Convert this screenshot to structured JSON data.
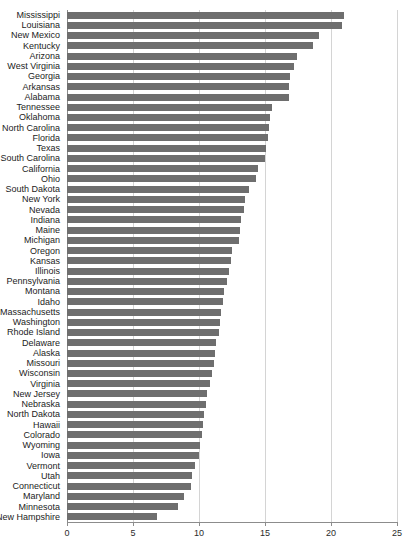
{
  "chart_data": {
    "type": "bar",
    "orientation": "horizontal",
    "title": "",
    "xlabel": "",
    "ylabel": "",
    "xlim": [
      0,
      25
    ],
    "xticks": [
      0,
      5,
      10,
      15,
      20,
      25
    ],
    "xtick_labels": [
      "0",
      "5",
      "10",
      "15",
      "20",
      "25"
    ],
    "grid": true,
    "legend": false,
    "bar_color": "#6e6e6e",
    "grid_color": "#d4d4d4",
    "axis_color": "#8c8c8c",
    "categories": [
      "Mississippi",
      "Louisiana",
      "New Mexico",
      "Kentucky",
      "Arizona",
      "West Virginia",
      "Georgia",
      "Arkansas",
      "Alabama",
      "Tennessee",
      "Oklahoma",
      "North Carolina",
      "Florida",
      "Texas",
      "South Carolina",
      "California",
      "Ohio",
      "South Dakota",
      "New York",
      "Nevada",
      "Indiana",
      "Maine",
      "Michigan",
      "Oregon",
      "Kansas",
      "Illinois",
      "Pennsylvania",
      "Montana",
      "Idaho",
      "Massachusetts",
      "Washington",
      "Rhode Island",
      "Delaware",
      "Alaska",
      "Missouri",
      "Wisconsin",
      "Virginia",
      "New Jersey",
      "Nebraska",
      "North Dakota",
      "Hawaii",
      "Colorado",
      "Wyoming",
      "Iowa",
      "Vermont",
      "Utah",
      "Connecticut",
      "Maryland",
      "Minnesota",
      "New Hampshire"
    ],
    "values": [
      21.0,
      20.8,
      19.1,
      18.6,
      17.4,
      17.2,
      16.9,
      16.8,
      16.8,
      15.5,
      15.4,
      15.3,
      15.2,
      15.1,
      15.0,
      14.5,
      14.3,
      13.8,
      13.5,
      13.4,
      13.2,
      13.1,
      13.0,
      12.5,
      12.4,
      12.3,
      12.1,
      11.9,
      11.8,
      11.7,
      11.6,
      11.5,
      11.3,
      11.2,
      11.1,
      11.0,
      10.8,
      10.6,
      10.5,
      10.4,
      10.3,
      10.2,
      10.1,
      10.0,
      9.7,
      9.5,
      9.4,
      8.9,
      8.4,
      6.8
    ]
  }
}
